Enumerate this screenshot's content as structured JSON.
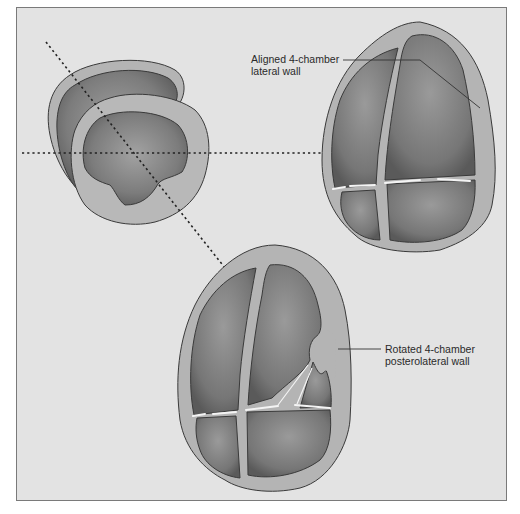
{
  "figure": {
    "type": "echocardiography view diagram",
    "background_color": "#e3e3e3",
    "border_color": "#7a7a7a",
    "myocardium_color": "#b4b4b4",
    "cavity_color": "#7c7c7c",
    "outline_color": "#3a3a3a"
  },
  "panels": [
    {
      "name": "short-axis-view",
      "description": "Short-axis cross section with horizontal and diagonal dotted cut planes"
    },
    {
      "name": "aligned-4-chamber-view",
      "description": "Aligned apical 4-chamber view"
    },
    {
      "name": "rotated-4-chamber-view",
      "description": "Rotated apical 4-chamber view"
    }
  ],
  "annotations": {
    "aligned": {
      "line1": "Aligned 4-chamber",
      "line2": "lateral wall"
    },
    "rotated": {
      "line1": "Rotated 4-chamber",
      "line2": "posterolateral wall"
    }
  },
  "cut_planes": [
    {
      "name": "horizontal-plane",
      "style": "dotted"
    },
    {
      "name": "oblique-plane",
      "style": "dotted"
    }
  ]
}
